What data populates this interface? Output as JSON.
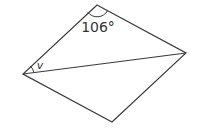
{
  "diagram": {
    "type": "rhombus-with-diagonal",
    "stroke_color": "#3a3a3a",
    "vertices": {
      "top": [
        97,
        5
      ],
      "right": [
        186,
        53
      ],
      "bottom": [
        112,
        122
      ],
      "left": [
        23,
        74
      ]
    },
    "diagonal": {
      "from": "left",
      "to": "right"
    },
    "angles": [
      {
        "vertex": "top",
        "label": "106°",
        "label_position": [
          98,
          32
        ]
      },
      {
        "vertex": "left",
        "label": "v",
        "label_position": [
          40,
          68
        ]
      }
    ]
  }
}
